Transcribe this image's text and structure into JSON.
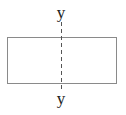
{
  "diagram": {
    "type": "geometry",
    "shape": "rectangle",
    "axis": {
      "orientation": "vertical",
      "style": "dashed",
      "label_top": "y",
      "label_bottom": "y"
    },
    "colors": {
      "stroke": "#8a8a8a",
      "axis": "#555555",
      "text": "#222222",
      "background": "#ffffff"
    }
  }
}
